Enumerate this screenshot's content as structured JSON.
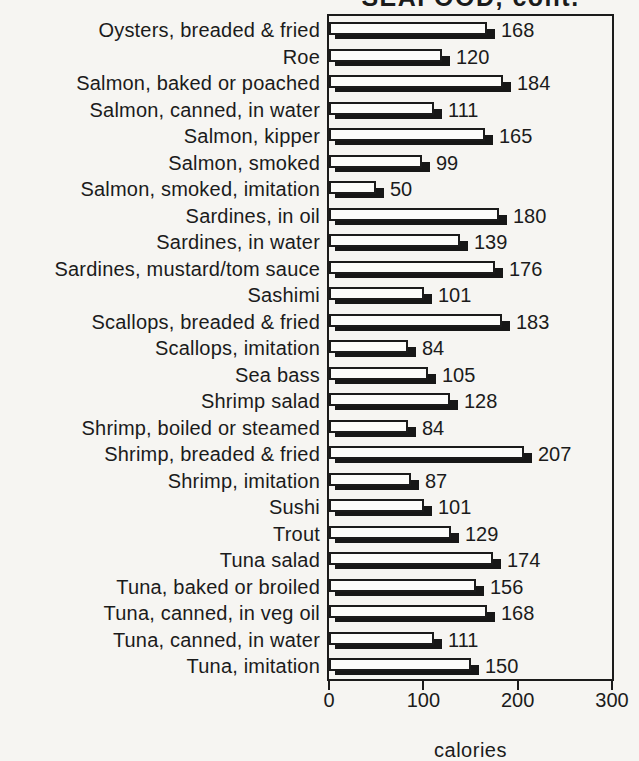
{
  "page": {
    "background": "#f6f5f2",
    "ink": "#1b1b1b"
  },
  "chart_data": {
    "type": "bar",
    "orientation": "horizontal",
    "title": "SEAFOOD, cont.",
    "title_clipped_at_top": true,
    "categories": [
      "Oysters, breaded & fried",
      "Roe",
      "Salmon, baked or poached",
      "Salmon, canned, in water",
      "Salmon, kipper",
      "Salmon, smoked",
      "Salmon, smoked, imitation",
      "Sardines, in oil",
      "Sardines, in water",
      "Sardines, mustard/tom sauce",
      "Sashimi",
      "Scallops, breaded & fried",
      "Scallops, imitation",
      "Sea bass",
      "Shrimp salad",
      "Shrimp, boiled or steamed",
      "Shrimp, breaded & fried",
      "Shrimp, imitation",
      "Sushi",
      "Trout",
      "Tuna salad",
      "Tuna, baked or broiled",
      "Tuna, canned, in veg oil",
      "Tuna, canned, in water",
      "Tuna, imitation"
    ],
    "values": [
      168,
      120,
      184,
      111,
      165,
      99,
      50,
      180,
      139,
      176,
      101,
      183,
      84,
      105,
      128,
      84,
      207,
      87,
      101,
      129,
      174,
      156,
      168,
      111,
      150
    ],
    "value_labels_shown": true,
    "xlabel": "calories",
    "xticks": [
      0,
      100,
      200,
      300
    ],
    "xlim": [
      0,
      300
    ],
    "grid": "off",
    "legend": "none",
    "bar_style": {
      "face_fill": "#fcfcfa",
      "outline": "#1b1b1b",
      "drop_shadow": "#171717"
    }
  }
}
